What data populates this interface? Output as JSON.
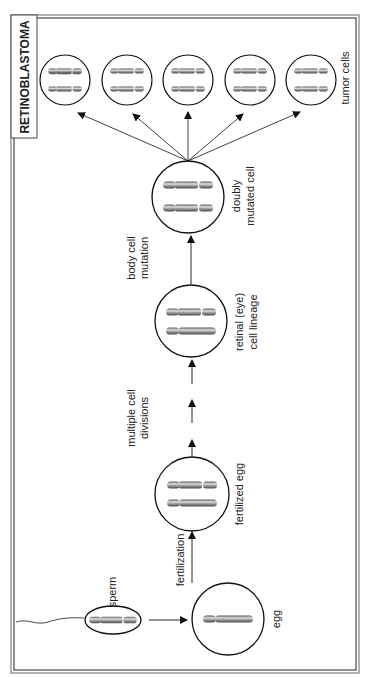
{
  "title": "RETINOBLASTOMA",
  "labels": {
    "sperm": "sperm",
    "egg": "egg",
    "fertilization": "fertilization",
    "fertilized_egg": "fertilized egg",
    "multiple_cell_divisions_1": "multiple cell",
    "multiple_cell_divisions_2": "divisions",
    "retinal_1": "retinal (eye)",
    "retinal_2": "cell lineage",
    "body_cell_mutation_1": "body cell",
    "body_cell_mutation_2": "mutation",
    "doubly_mutated_1": "doubly",
    "doubly_mutated_2": "mutated cell",
    "tumor_cells": "tumor cells"
  },
  "colors": {
    "line": "#1a1a1a",
    "frame_outer": "#9a9a9a",
    "chromosome_light": "#d8d8d8",
    "chromosome_dark": "#6a6a6a"
  },
  "stages": [
    {
      "id": "sperm",
      "chromosomes": [
        {
          "mutated": true
        }
      ]
    },
    {
      "id": "egg",
      "chromosomes": [
        {
          "mutated": false
        }
      ]
    },
    {
      "id": "fertilized_egg",
      "chromosomes": [
        {
          "mutated": true
        },
        {
          "mutated": false
        }
      ]
    },
    {
      "id": "retinal_cell",
      "chromosomes": [
        {
          "mutated": true
        },
        {
          "mutated": false
        }
      ]
    },
    {
      "id": "doubly_mutated_cell",
      "chromosomes": [
        {
          "mutated": true
        },
        {
          "mutated": true
        }
      ]
    },
    {
      "id": "tumor_cells",
      "count": 5,
      "chromosomes": [
        {
          "mutated": true
        },
        {
          "mutated": true
        }
      ]
    }
  ]
}
